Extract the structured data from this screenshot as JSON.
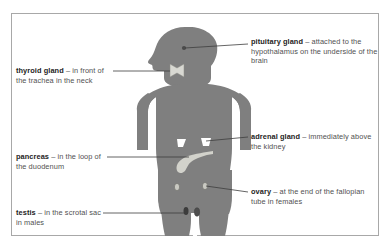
{
  "figure": {
    "body_color": "#7f7f7f",
    "organ_light_color": "#d2d2cb",
    "organ_white_color": "#ffffff",
    "organ_dark_color": "#3c3c3c",
    "leader_line_color": "#3d3d3d",
    "border_color": "#a8a8a8",
    "background_color": "#ffffff",
    "term_color": "#1d1d1d",
    "description_color": "#515151"
  },
  "callouts": [
    {
      "id": "pituitary",
      "term": "pituitary gland",
      "dash": " – ",
      "description": "attached to the hypothalamus on the underside of the brain",
      "lines": [
        "attached to",
        "the hypothalamus on the",
        "underside of the brain"
      ],
      "side": "right",
      "organ": "pituitary-gland"
    },
    {
      "id": "thyroid",
      "term": "thyroid gland",
      "dash": " – ",
      "description": "in front of the trachea in the neck",
      "lines": [
        "in",
        "front of the trachea",
        "in the neck"
      ],
      "side": "left",
      "organ": "thyroid-gland"
    },
    {
      "id": "pancreas",
      "term": "pancreas",
      "dash": " – ",
      "description": "in the loop of the duodenum",
      "lines": [
        "in the",
        "loop of the duodenum"
      ],
      "side": "left",
      "organ": "pancreas"
    },
    {
      "id": "adrenal",
      "term": "adrenal gland",
      "dash": " – ",
      "description": "immediately above the kidney",
      "lines": [
        "immediately",
        "above the kidney"
      ],
      "side": "right",
      "organ": "adrenal-gland"
    },
    {
      "id": "ovary",
      "term": "ovary",
      "dash": " – ",
      "description": "at the end of the fallopian tube in females",
      "lines": [
        "at the end of the",
        "fallopian tube in females"
      ],
      "side": "right",
      "organ": "ovary"
    },
    {
      "id": "testis",
      "term": "testis",
      "dash": " – ",
      "description": "in the scrotal sac in males",
      "lines": [
        "in the",
        "scrotal sac in males"
      ],
      "side": "left",
      "organ": "testis"
    }
  ]
}
